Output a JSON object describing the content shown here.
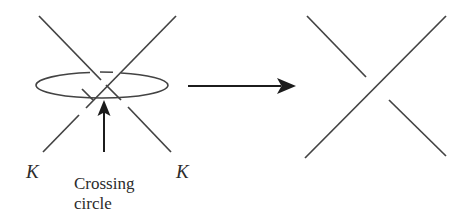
{
  "figure": {
    "background_color": "#ffffff",
    "stroke_color": "#434343",
    "text_color": "#2b2b2b",
    "arrow_color": "#1c1c1c",
    "width": 464,
    "height": 213
  },
  "labels": {
    "k_left": "K",
    "k_right": "K",
    "caption_line1": "Crossing",
    "caption_line2": "circle"
  },
  "left_diagram": {
    "name": "knot-with-crossing-circle",
    "crossing_point": {
      "x": 107,
      "y": 77
    },
    "strand_nw_se": {
      "start": {
        "x": 39,
        "y": 16
      },
      "end": {
        "x": 171,
        "y": 152
      },
      "break_after_crossing": {
        "from": {
          "x": 90,
          "y": 93
        },
        "to": {
          "x": 78,
          "y": 105
        }
      }
    },
    "strand_sw_ne": {
      "start": {
        "x": 43,
        "y": 152
      },
      "end": {
        "x": 176,
        "y": 16
      }
    },
    "crossing_circle": {
      "center_x": 102,
      "center_y": 85,
      "radius_x": 66,
      "radius_y": 13,
      "gap_top_left": {
        "from_deg": 205,
        "to_deg": 228
      },
      "gap_top_right": {
        "from_deg": 238,
        "to_deg": 262
      }
    },
    "pointer_arrow": {
      "from": {
        "x": 104,
        "y": 152
      },
      "to": {
        "x": 104,
        "y": 100
      }
    }
  },
  "transform_arrow": {
    "name": "implies-arrow",
    "from": {
      "x": 188,
      "y": 86
    },
    "to": {
      "x": 296,
      "y": 86
    },
    "head_length": 17,
    "head_half_width": 8
  },
  "right_diagram": {
    "name": "resolved-crossing",
    "crossing_point": {
      "x": 377,
      "y": 88
    },
    "strand_nw_se": {
      "start": {
        "x": 307,
        "y": 16
      },
      "end": {
        "x": 446,
        "y": 156
      },
      "break_at_crossing": {
        "from": {
          "x": 365,
          "y": 76
        },
        "to": {
          "x": 389,
          "y": 100
        }
      }
    },
    "strand_sw_ne": {
      "start": {
        "x": 305,
        "y": 158
      },
      "end": {
        "x": 446,
        "y": 16
      }
    }
  },
  "label_positions": {
    "k_left": {
      "x": 26,
      "y": 178
    },
    "k_right": {
      "x": 176,
      "y": 178
    },
    "caption_line1": {
      "x": 74,
      "y": 189
    },
    "caption_line2": {
      "x": 74,
      "y": 209
    }
  }
}
